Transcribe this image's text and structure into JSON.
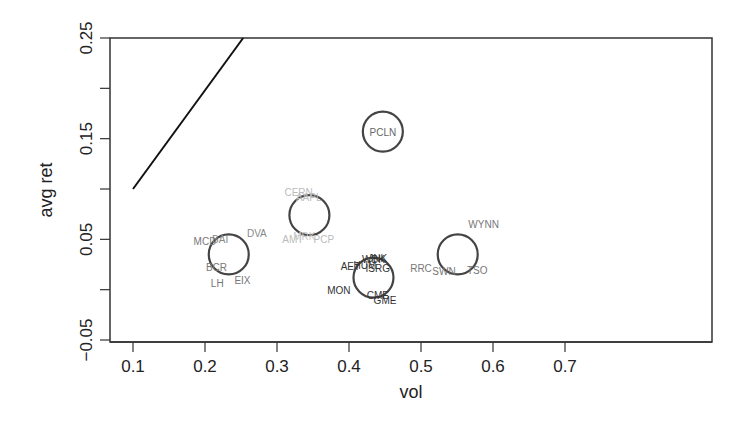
{
  "chart_data": {
    "type": "scatter",
    "title": "",
    "xlabel": "vol",
    "ylabel": "avg ret",
    "xlim": [
      0.075,
      0.775
    ],
    "ylim": [
      -0.05,
      0.25
    ],
    "x_ticks": [
      0.1,
      0.2,
      0.3,
      0.4,
      0.5,
      0.6,
      0.7
    ],
    "x_tick_labels": [
      "0.1",
      "0.2",
      "0.3",
      "0.4",
      "0.5",
      "0.6",
      "0.7"
    ],
    "y_ticks": [
      -0.05,
      0.0,
      0.05,
      0.1,
      0.15,
      0.2,
      0.25
    ],
    "y_tick_labels": [
      "-0.05",
      "",
      "0.05",
      "",
      "0.15",
      "",
      "0.25"
    ],
    "grid": false,
    "legend": null,
    "line": {
      "x": [
        0.1,
        0.253
      ],
      "y": [
        0.1,
        0.25
      ],
      "color": "#111111"
    },
    "points": [
      {
        "label": "MCD",
        "x": 0.2,
        "y": 0.048,
        "color": "#777777"
      },
      {
        "label": "BAI",
        "x": 0.221,
        "y": 0.05,
        "color": "#888888"
      },
      {
        "label": "BCR",
        "x": 0.216,
        "y": 0.023,
        "color": "#777777"
      },
      {
        "label": "LH",
        "x": 0.217,
        "y": 0.007,
        "color": "#777777"
      },
      {
        "label": "EIX",
        "x": 0.252,
        "y": 0.01,
        "color": "#777777"
      },
      {
        "label": "DVA",
        "x": 0.272,
        "y": 0.056,
        "color": "#888888"
      },
      {
        "label": "CERN",
        "x": 0.33,
        "y": 0.097,
        "color": "#bbbbbb"
      },
      {
        "label": "AAPL",
        "x": 0.344,
        "y": 0.092,
        "color": "#bbbbbb"
      },
      {
        "label": "AMT",
        "x": 0.322,
        "y": 0.05,
        "color": "#bbbbbb"
      },
      {
        "label": "MRK",
        "x": 0.338,
        "y": 0.053,
        "color": "#c8c8c8"
      },
      {
        "label": "PCP",
        "x": 0.365,
        "y": 0.05,
        "color": "#bbbbbb"
      },
      {
        "label": "PCLN",
        "x": 0.447,
        "y": 0.157,
        "color": "#666666"
      },
      {
        "label": "AET",
        "x": 0.402,
        "y": 0.024,
        "color": "#333333"
      },
      {
        "label": "HUM",
        "x": 0.422,
        "y": 0.025,
        "color": "#333333"
      },
      {
        "label": "WBK",
        "x": 0.434,
        "y": 0.03,
        "color": "#333333"
      },
      {
        "label": "JNK",
        "x": 0.44,
        "y": 0.031,
        "color": "#333333"
      },
      {
        "label": "ISRG",
        "x": 0.44,
        "y": 0.022,
        "color": "#333333"
      },
      {
        "label": "MON",
        "x": 0.386,
        "y": -0.0,
        "color": "#333333"
      },
      {
        "label": "CME",
        "x": 0.44,
        "y": -0.005,
        "color": "#333333"
      },
      {
        "label": "GME",
        "x": 0.45,
        "y": -0.01,
        "color": "#333333"
      },
      {
        "label": "RRC",
        "x": 0.5,
        "y": 0.022,
        "color": "#777777"
      },
      {
        "label": "SWN",
        "x": 0.532,
        "y": 0.019,
        "color": "#777777"
      },
      {
        "label": "TSO",
        "x": 0.578,
        "y": 0.02,
        "color": "#777777"
      },
      {
        "label": "WYNN",
        "x": 0.587,
        "y": 0.065,
        "color": "#777777"
      }
    ],
    "circles": [
      {
        "x": 0.233,
        "y": 0.035,
        "r_px": 20
      },
      {
        "x": 0.345,
        "y": 0.074,
        "r_px": 20
      },
      {
        "x": 0.447,
        "y": 0.157,
        "r_px": 20
      },
      {
        "x": 0.434,
        "y": 0.012,
        "r_px": 20
      },
      {
        "x": 0.551,
        "y": 0.035,
        "r_px": 20
      }
    ]
  }
}
